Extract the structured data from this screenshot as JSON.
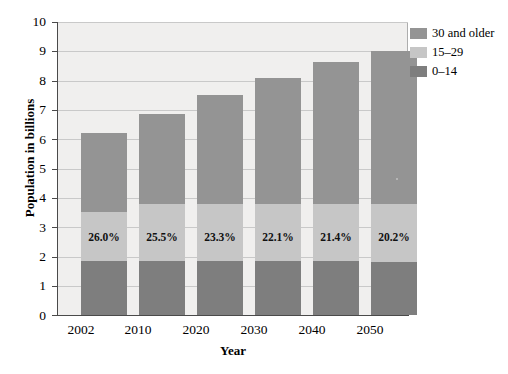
{
  "chart_data": {
    "type": "bar",
    "subtype": "stacked-bar",
    "title": "",
    "xlabel": "Year",
    "ylabel": "Population in billions",
    "categories": [
      "2002",
      "2010",
      "2020",
      "2030",
      "2040",
      "2050"
    ],
    "ylim": [
      0,
      10
    ],
    "yticks": [
      0,
      1,
      2,
      3,
      4,
      5,
      6,
      7,
      8,
      9,
      10
    ],
    "ytick_labels": [
      "0",
      "1",
      "2",
      "3",
      "4",
      "5",
      "6",
      "7",
      "8",
      "9",
      "10"
    ],
    "grid": true,
    "legend_position": "right-top",
    "series": [
      {
        "name": "30 and older",
        "color": "#949494",
        "values": [
          2.7,
          3.05,
          3.7,
          4.3,
          4.85,
          5.2
        ]
      },
      {
        "name": "15–29",
        "color": "#c6c6c6",
        "values": [
          1.65,
          1.95,
          1.95,
          1.95,
          1.95,
          1.98
        ]
      },
      {
        "name": "0–14",
        "color": "#7e7e7e",
        "values": [
          1.85,
          1.85,
          1.85,
          1.85,
          1.85,
          1.82
        ]
      }
    ],
    "totals": [
      6.2,
      6.85,
      7.5,
      8.1,
      8.65,
      9.0
    ],
    "annotations": {
      "label": "share of population aged 0–14",
      "values": [
        "26.0%",
        "25.5%",
        "23.3%",
        "22.1%",
        "21.4%",
        "20.2%"
      ]
    }
  },
  "axes": {
    "ylabel": "Population in billions",
    "xlabel": "Year",
    "ytick_labels": [
      "10",
      "9",
      "8",
      "7",
      "6",
      "5",
      "4",
      "3",
      "2",
      "1",
      "0"
    ],
    "xtick_labels": [
      "2002",
      "2010",
      "2020",
      "2030",
      "2040",
      "2050"
    ]
  },
  "legend": {
    "items": [
      {
        "label": "30 and older",
        "color": "#949494"
      },
      {
        "label": "15–29",
        "color": "#c6c6c6"
      },
      {
        "label": "0–14",
        "color": "#7e7e7e"
      }
    ]
  },
  "colors": {
    "plot_background": "#f0efee",
    "gridline": "#c9c9c9",
    "axis": "#4a4a4a",
    "page_background": "#ffffff"
  }
}
